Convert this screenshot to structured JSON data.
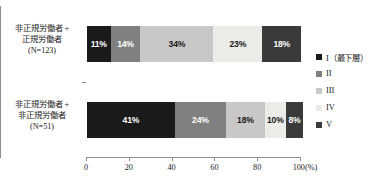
{
  "chart_data": {
    "type": "bar",
    "orientation": "horizontal",
    "stacked": true,
    "stack_mode": "percent",
    "title": "",
    "xlabel": "(%)",
    "ylabel": "",
    "xlim": [
      0,
      100
    ],
    "xticks": [
      0,
      20,
      40,
      60,
      80,
      100
    ],
    "xticklabels": [
      "0",
      "20",
      "40",
      "60",
      "80",
      "100(%)"
    ],
    "grid": false,
    "legend_position": "right",
    "categories": [
      "非正規労働者＋正規労働者（N=123）",
      "非正規労働者＋非正規労働者（N=51）"
    ],
    "category_lines": [
      [
        "非正規労働者 +",
        "正規労働者",
        "(N=123)"
      ],
      [
        "非正規労働者 +",
        "非正規労働者",
        "(N=51)"
      ]
    ],
    "series": [
      {
        "name": "I（最下層）",
        "color": "#1a1a1a",
        "text_on": "dark",
        "values": [
          11,
          41
        ]
      },
      {
        "name": "II",
        "color": "#808080",
        "text_on": "dark",
        "values": [
          14,
          24
        ]
      },
      {
        "name": "III",
        "color": "#c8c8c8",
        "text_on": "light",
        "values": [
          34,
          18
        ]
      },
      {
        "name": "IV",
        "color": "#ebebe8",
        "text_on": "light",
        "values": [
          23,
          10
        ]
      },
      {
        "name": "V",
        "color": "#3a3a3a",
        "text_on": "dark",
        "values": [
          18,
          8
        ]
      }
    ],
    "data_labels": [
      [
        "11%",
        "14%",
        "34%",
        "23%",
        "18%"
      ],
      [
        "41%",
        "24%",
        "18%",
        "10%",
        "8%"
      ]
    ]
  },
  "legend": {
    "items": [
      {
        "label": "I（最下層）",
        "color": "#1a1a1a"
      },
      {
        "label": "II",
        "color": "#808080"
      },
      {
        "label": "III",
        "color": "#c8c8c8"
      },
      {
        "label": "IV",
        "color": "#ebebe8"
      },
      {
        "label": "V",
        "color": "#3a3a3a"
      }
    ]
  },
  "axis": {
    "x_labels": [
      "0",
      "20",
      "40",
      "60",
      "80",
      "100(%)"
    ]
  }
}
